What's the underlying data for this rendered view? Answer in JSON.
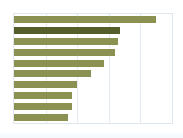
{
  "chart_data": {
    "type": "bar",
    "orientation": "horizontal",
    "title": "",
    "subtitle": "",
    "xlabel": "",
    "ylabel": "",
    "categories": [
      "1",
      "2",
      "3",
      "4",
      "5",
      "6",
      "7",
      "8",
      "9",
      "10"
    ],
    "values": [
      90,
      67,
      66,
      64,
      57,
      49,
      40,
      37,
      37,
      34
    ],
    "xlim": [
      0,
      100
    ],
    "ylim": null,
    "grid": true,
    "gridlines_x": [
      20,
      40,
      60,
      80
    ],
    "axis_tick_labels_x": [],
    "axis_tick_labels_y": [],
    "legend": {
      "show": false,
      "position": "none",
      "entries": []
    },
    "annotations": [],
    "series": [
      {
        "name": "series-1",
        "values": [
          90,
          67,
          66,
          64,
          57,
          49,
          40,
          37,
          37,
          34
        ],
        "highlight_index": 1
      }
    ],
    "colors": {
      "bar": "#8b9150",
      "bar_highlight": "#555d2b",
      "gridline": "#e3eaf1",
      "frame": "#dfe7ee",
      "background": "#ffffff"
    }
  }
}
